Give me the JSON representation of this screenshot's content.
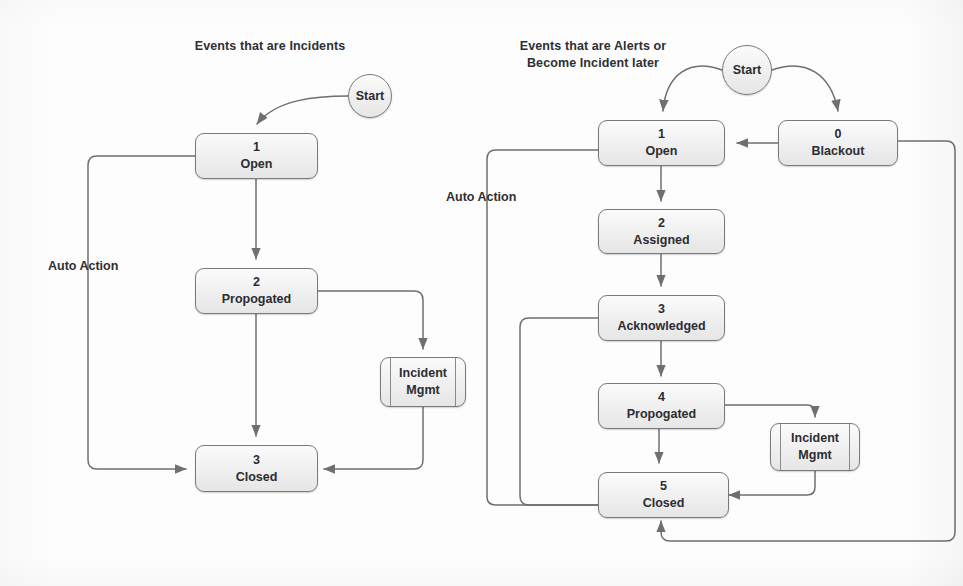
{
  "page": {
    "width": 963,
    "height": 586,
    "background": "#fdfdfd"
  },
  "style": {
    "node_border": "#7a7a7e",
    "node_fill_top": "#fbfbfb",
    "node_fill_bottom": "#e6e6e6",
    "line_color": "#6f6f73",
    "text_color": "#2c2c30"
  },
  "diagrams": [
    {
      "id": "incidents",
      "title": "Events that are Incidents",
      "start": {
        "label": "Start"
      },
      "nodes": [
        {
          "id": "l_open",
          "num": "1",
          "label": "Open",
          "shape": "state"
        },
        {
          "id": "l_prop",
          "num": "2",
          "label": "Propogated",
          "shape": "state"
        },
        {
          "id": "l_closed",
          "num": "3",
          "label": "Closed",
          "shape": "state"
        },
        {
          "id": "l_incmgmt",
          "num": "",
          "label": "Incident Mgmt",
          "label_line1": "Incident",
          "label_line2": "Mgmt",
          "shape": "subroutine"
        }
      ],
      "edge_labels": [
        "Auto Action"
      ],
      "transitions": [
        {
          "from": "Start",
          "to": "1 Open"
        },
        {
          "from": "1 Open",
          "to": "2 Propogated"
        },
        {
          "from": "2 Propogated",
          "to": "3 Closed"
        },
        {
          "from": "2 Propogated",
          "to": "Incident Mgmt"
        },
        {
          "from": "Incident Mgmt",
          "to": "3 Closed"
        },
        {
          "from": "1 Open",
          "to": "3 Closed",
          "label": "Auto Action"
        }
      ]
    },
    {
      "id": "alerts",
      "title": "Events that are Alerts or\nBecome Incident later",
      "start": {
        "label": "Start"
      },
      "nodes": [
        {
          "id": "r_open",
          "num": "1",
          "label": "Open",
          "shape": "state"
        },
        {
          "id": "r_black",
          "num": "0",
          "label": "Blackout",
          "shape": "state"
        },
        {
          "id": "r_assign",
          "num": "2",
          "label": "Assigned",
          "shape": "state"
        },
        {
          "id": "r_ack",
          "num": "3",
          "label": "Acknowledged",
          "shape": "state"
        },
        {
          "id": "r_prop",
          "num": "4",
          "label": "Propogated",
          "shape": "state"
        },
        {
          "id": "r_closed",
          "num": "5",
          "label": "Closed",
          "shape": "state"
        },
        {
          "id": "r_incmgmt",
          "num": "",
          "label": "Incident Mgmt",
          "label_line1": "Incident",
          "label_line2": "Mgmt",
          "shape": "subroutine"
        }
      ],
      "edge_labels": [
        "Auto Action"
      ],
      "transitions": [
        {
          "from": "Start",
          "to": "1 Open"
        },
        {
          "from": "Start",
          "to": "0 Blackout"
        },
        {
          "from": "0 Blackout",
          "to": "1 Open"
        },
        {
          "from": "1 Open",
          "to": "2 Assigned"
        },
        {
          "from": "2 Assigned",
          "to": "3 Acknowledged"
        },
        {
          "from": "3 Acknowledged",
          "to": "4 Propogated"
        },
        {
          "from": "4 Propogated",
          "to": "5 Closed"
        },
        {
          "from": "4 Propogated",
          "to": "Incident Mgmt"
        },
        {
          "from": "Incident Mgmt",
          "to": "5 Closed"
        },
        {
          "from": "1 Open",
          "to": "5 Closed",
          "label": "Auto Action"
        },
        {
          "from": "3 Acknowledged",
          "to": "5 Closed"
        },
        {
          "from": "0 Blackout",
          "to": "5 Closed"
        }
      ]
    }
  ]
}
